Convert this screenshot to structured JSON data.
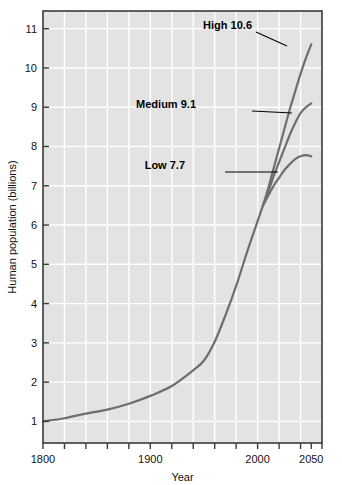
{
  "chart_data": {
    "type": "line",
    "title": "",
    "xlabel": "Year",
    "ylabel": "Human population (billions)",
    "xlim": [
      1800,
      2060
    ],
    "ylim": [
      0.45,
      11.45
    ],
    "grid": true,
    "legend_position": "inline-annotations",
    "background_color": "#e3e3e3",
    "gridline_color": "#ffffff",
    "frame_color": "#3a3a3a",
    "series_color": "#6e6e6e",
    "x_ticks_major": [
      1800,
      1900,
      2000,
      2050
    ],
    "x_tick_labels": [
      "1800",
      "1900",
      "2000",
      "2050"
    ],
    "x_ticks_minor": [
      1820,
      1840,
      1860,
      1880,
      1920,
      1940,
      1960,
      1980,
      2020,
      2040,
      2060
    ],
    "y_ticks": [
      1,
      2,
      3,
      4,
      5,
      6,
      7,
      8,
      9,
      10,
      11
    ],
    "y_tick_labels": [
      "1",
      "2",
      "3",
      "4",
      "5",
      "6",
      "7",
      "8",
      "9",
      "10",
      "11"
    ],
    "x_gridlines": [
      1820,
      1840,
      1860,
      1880,
      1900,
      1920,
      1940,
      1960,
      1980,
      2000,
      2020,
      2040
    ],
    "series": [
      {
        "name": "Historical",
        "label": "",
        "x": [
          1800,
          1820,
          1840,
          1860,
          1880,
          1900,
          1920,
          1940,
          1950,
          1960,
          1970,
          1980,
          1990,
          2000,
          2005
        ],
        "values": [
          1.0,
          1.08,
          1.2,
          1.3,
          1.45,
          1.65,
          1.9,
          2.3,
          2.55,
          3.03,
          3.7,
          4.45,
          5.3,
          6.1,
          6.5
        ]
      },
      {
        "name": "High",
        "label": "High 10.6",
        "final_value": 10.6,
        "final_year": 2050,
        "x": [
          2005,
          2010,
          2015,
          2020,
          2025,
          2030,
          2035,
          2040,
          2045,
          2050
        ],
        "values": [
          6.5,
          6.95,
          7.45,
          7.95,
          8.45,
          8.95,
          9.4,
          9.85,
          10.25,
          10.6
        ]
      },
      {
        "name": "Medium",
        "label": "Medium 9.1",
        "final_value": 9.1,
        "final_year": 2050,
        "x": [
          2005,
          2010,
          2015,
          2020,
          2025,
          2030,
          2035,
          2040,
          2045,
          2050
        ],
        "values": [
          6.5,
          6.85,
          7.25,
          7.6,
          7.95,
          8.3,
          8.6,
          8.85,
          9.0,
          9.1
        ]
      },
      {
        "name": "Low",
        "label": "Low 7.7",
        "final_value": 7.7,
        "final_year": 2050,
        "x": [
          2005,
          2010,
          2015,
          2020,
          2025,
          2030,
          2035,
          2040,
          2045,
          2050
        ],
        "values": [
          6.5,
          6.75,
          7.0,
          7.2,
          7.4,
          7.55,
          7.68,
          7.75,
          7.78,
          7.75
        ]
      }
    ],
    "annotations": [
      {
        "name": "high-annotation",
        "text": "High 10.6",
        "label_x": 252,
        "label_y": 29,
        "leader_from_x": 256,
        "leader_from_y": 32,
        "leader_to_x": 287,
        "leader_to_y": 46
      },
      {
        "name": "medium-annotation",
        "text": "Medium 9.1",
        "label_x": 196,
        "label_y": 108,
        "leader_from_x": 252,
        "leader_from_y": 111,
        "leader_to_x": 292,
        "leader_to_y": 113
      },
      {
        "name": "low-annotation",
        "text": "Low 7.7",
        "label_x": 185,
        "label_y": 169,
        "leader_from_x": 225,
        "leader_from_y": 172,
        "leader_to_x": 278,
        "leader_to_y": 172
      }
    ]
  }
}
